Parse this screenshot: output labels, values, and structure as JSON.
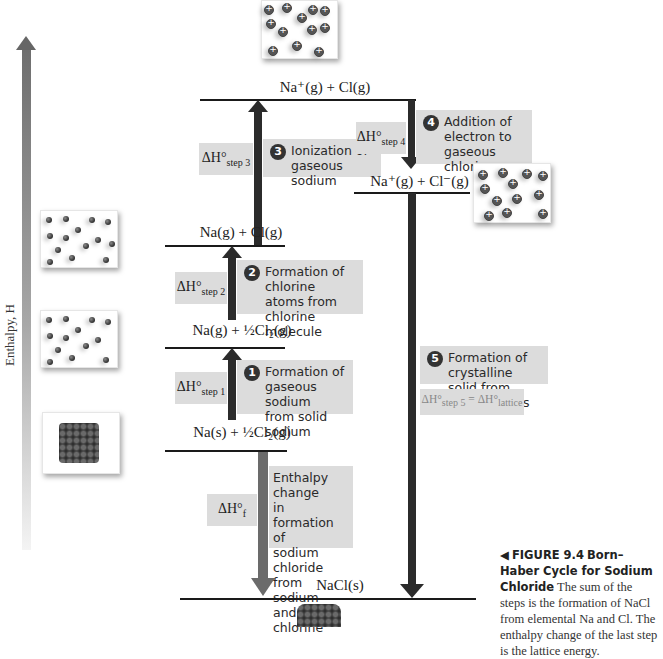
{
  "figure": {
    "number_label": "FIGURE 9.4",
    "title": "Born–Haber Cycle for Sodium Chloride",
    "caption": "The sum of the steps is the formation of NaCl from elemental Na and Cl. The enthalpy change of the last step is the lattice energy.",
    "caption_icon": "left-triangle-pointer"
  },
  "axis": {
    "label": "Enthalpy, H",
    "direction": "up",
    "gradient_colors": [
      "#f2f2f2",
      "#6e6e6e"
    ]
  },
  "levels": [
    {
      "id": "na-plus-cl",
      "label": "Na⁺(g) + Cl(g)"
    },
    {
      "id": "na-plus-cl-minus",
      "label": "Na⁺(g) + Cl⁻(g)"
    },
    {
      "id": "na-g-cl-g",
      "label": "Na(g) + Cl(g)"
    },
    {
      "id": "na-g-half-cl2",
      "label": "Na(g) + ½Cl₂(g)"
    },
    {
      "id": "na-s-half-cl2",
      "label": "Na(s) + ½Cl₂(g)"
    },
    {
      "id": "nacl-s",
      "label": "NaCl(s)"
    }
  ],
  "steps": [
    {
      "number": "1",
      "description": "Formation of gaseous sodium from solid sodium",
      "lines": [
        "Formation of",
        "gaseous sodium",
        "from solid sodium"
      ],
      "dh": "ΔH°",
      "dh_sub": "step 1",
      "direction": "up"
    },
    {
      "number": "2",
      "description": "Formation of chlorine atoms from chlorine molecule",
      "lines": [
        "Formation of",
        "chlorine atoms from",
        "chlorine molecule"
      ],
      "dh": "ΔH°",
      "dh_sub": "step 2",
      "direction": "up"
    },
    {
      "number": "3",
      "description": "Ionization of gaseous sodium",
      "lines": [
        "Ionization of",
        "gaseous sodium"
      ],
      "dh": "ΔH°",
      "dh_sub": "step 3",
      "direction": "up"
    },
    {
      "number": "4",
      "description": "Addition of electron to gaseous chlorine",
      "lines": [
        "Addition of",
        "electron to gaseous",
        "chlorine"
      ],
      "dh": "ΔH°",
      "dh_sub": "step 4",
      "direction": "down"
    },
    {
      "number": "5",
      "description": "Formation of crystalline solid from gaseous ions",
      "lines": [
        "Formation of crystalline",
        "solid from gaseous ions"
      ],
      "dh": "ΔH°",
      "dh_sub": "step 5",
      "dh_equals": "= ΔH°",
      "dh_equals_sub": "lattice",
      "direction": "down"
    }
  ],
  "formation": {
    "dh": "ΔH°",
    "dh_sub": "f",
    "lines": [
      "Enthalpy change",
      "in formation of",
      "sodium chloride",
      "from sodium",
      "and chlorine"
    ],
    "direction": "down"
  },
  "colors": {
    "label_box": "#dcdcdc",
    "step_arrow": "#2b2b2b",
    "formation_arrow": "#6b6b6b",
    "level_line": "#1a1a1a"
  }
}
